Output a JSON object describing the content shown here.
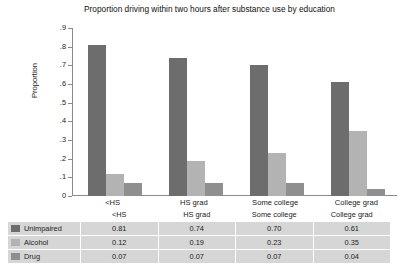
{
  "chart_data": {
    "type": "bar",
    "title": "Proportion driving within two hours after substance use by education",
    "xlabel": "",
    "ylabel": "Proportion",
    "ylim": [
      0,
      0.9
    ],
    "yticks": [
      "0",
      ".1",
      ".2",
      ".3",
      ".4",
      ".5",
      ".6",
      ".7",
      ".8",
      ".9"
    ],
    "ytick_values": [
      0,
      0.1,
      0.2,
      0.3,
      0.4,
      0.5,
      0.6,
      0.7,
      0.8,
      0.9
    ],
    "grid": false,
    "legend_position": "below-table",
    "categories": [
      "<HS",
      "HS grad",
      "Some college",
      "College grad"
    ],
    "series": [
      {
        "name": "Unimpaired",
        "color": "#6d6d6d",
        "values": [
          0.81,
          0.74,
          0.7,
          0.61
        ]
      },
      {
        "name": "Alcohol",
        "color": "#b3b3b3",
        "values": [
          0.12,
          0.19,
          0.23,
          0.35
        ]
      },
      {
        "name": "Drug",
        "color": "#8f8f8f",
        "values": [
          0.07,
          0.07,
          0.07,
          0.04
        ]
      }
    ]
  },
  "table": {
    "header": [
      "",
      "<HS",
      "HS grad",
      "Some college",
      "College grad"
    ],
    "rows": [
      {
        "label": "Unimpaired",
        "color": "#6d6d6d",
        "values": [
          "0.81",
          "0.74",
          "0.70",
          "0.61"
        ]
      },
      {
        "label": "Alcohol",
        "color": "#b3b3b3",
        "values": [
          "0.12",
          "0.19",
          "0.23",
          "0.35"
        ]
      },
      {
        "label": "Drug",
        "color": "#8f8f8f",
        "values": [
          "0.07",
          "0.07",
          "0.07",
          "0.04"
        ]
      }
    ]
  },
  "colors": {
    "axis": "#8a8a8a",
    "text": "#222222",
    "table_cell_bg": "#d6d6d6",
    "background": "#ffffff"
  }
}
